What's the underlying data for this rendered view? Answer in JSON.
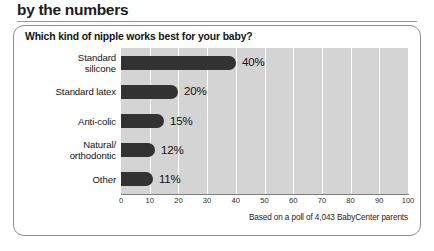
{
  "header": {
    "kicker": "by the numbers"
  },
  "card": {
    "question": "Which kind of nipple works best for your baby?",
    "source": "Based on a poll of 4,043 BabyCenter parents"
  },
  "chart_data": {
    "type": "bar",
    "orientation": "horizontal",
    "title": "Which kind of nipple works best for your baby?",
    "subtitle": "by the numbers",
    "xlabel": "",
    "ylabel": "",
    "xlim": [
      0,
      100
    ],
    "grid": true,
    "legend": false,
    "categories": [
      "Standard silicone",
      "Standard latex",
      "Anti-colic",
      "Natural/orthodontic",
      "Other"
    ],
    "category_lines": [
      [
        "Standard",
        "silicone"
      ],
      [
        "Standard latex"
      ],
      [
        "Anti-colic"
      ],
      [
        "Natural/",
        "orthodontic"
      ],
      [
        "Other"
      ]
    ],
    "values": [
      40,
      20,
      15,
      12,
      11
    ],
    "value_labels": [
      "40%",
      "20%",
      "15%",
      "12%",
      "11%"
    ],
    "xticks": [
      0,
      10,
      20,
      30,
      40,
      50,
      60,
      70,
      80,
      90,
      100
    ],
    "xtick_labels": [
      "0",
      "10",
      "20",
      "30",
      "40",
      "50",
      "60",
      "70",
      "80",
      "90",
      "100"
    ],
    "annotation": "Based on a poll of 4,043 BabyCenter parents",
    "colors": {
      "bar": "#323232",
      "plot_background": "#d4d4d4",
      "gridline": "#ffffff",
      "axis": "#7d7d7d",
      "text": "#141414",
      "card_border": "#8f8f8f",
      "page_background": "#ffffff"
    }
  }
}
